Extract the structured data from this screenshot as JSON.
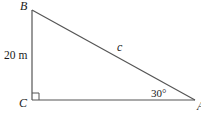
{
  "diagram": {
    "type": "right-triangle",
    "vertices": {
      "B": {
        "label": "B",
        "x": 32,
        "y": 10
      },
      "C": {
        "label": "C",
        "x": 32,
        "y": 100
      },
      "A": {
        "label": "A",
        "x": 195,
        "y": 100
      }
    },
    "side_labels": {
      "BC": "20 m",
      "AB": "c"
    },
    "angle_labels": {
      "A": "30°"
    },
    "right_angle_at": "C",
    "colors": {
      "line": "#555555",
      "text": "#1a1a1a",
      "background": "#ffffff"
    }
  }
}
